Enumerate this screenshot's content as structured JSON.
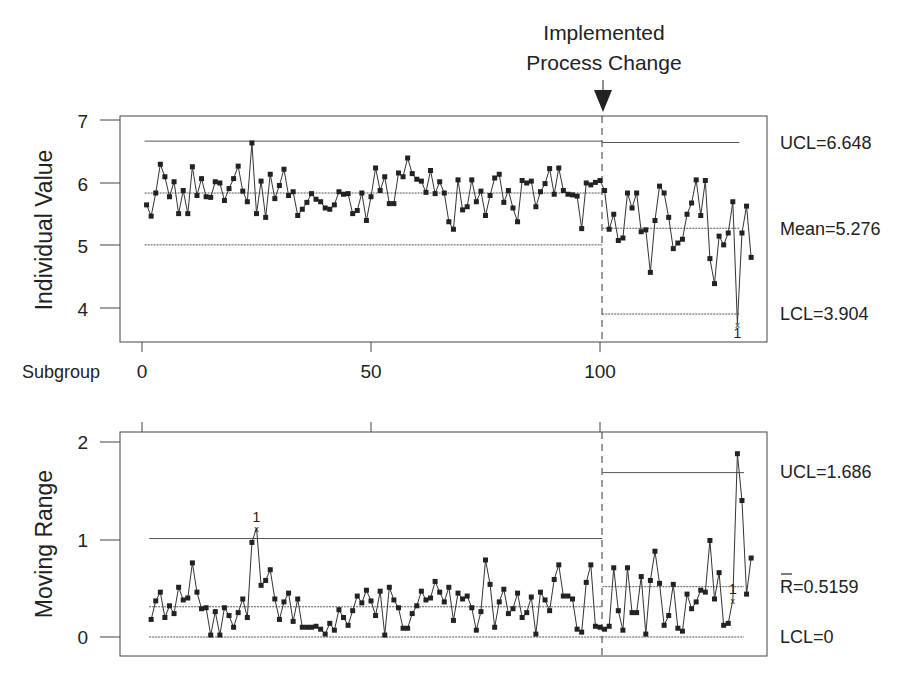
{
  "annotation": {
    "line1": "Implemented",
    "line2": "Process Change",
    "change_at_subgroup": 100.5
  },
  "chart_data": [
    {
      "type": "line",
      "title": "I Chart",
      "ylabel": "Individual Value",
      "xlabel": "Subgroup",
      "ylim": [
        3.8,
        7.05
      ],
      "yticks": [
        4,
        5,
        6,
        7
      ],
      "xticks": [
        0,
        50,
        100
      ],
      "xlim": [
        0,
        130
      ],
      "grid": false,
      "limits": {
        "phase1": {
          "UCL": 6.67,
          "center": 5.84,
          "LCL": 5.01,
          "from": 1,
          "to": 100
        },
        "phase2": {
          "UCL": 6.648,
          "center": 5.276,
          "LCL": 3.904,
          "from": 101,
          "to": 130
        }
      },
      "limit_labels": {
        "ucl": "UCL=6.648",
        "center": "Mean=5.276",
        "lcl": "LCL=3.904"
      },
      "series": [
        {
          "name": "Individual Value",
          "values": [
            5.65,
            5.47,
            5.84,
            6.3,
            6.1,
            5.78,
            6.02,
            5.51,
            5.88,
            5.51,
            6.26,
            5.8,
            6.07,
            5.78,
            5.77,
            6.02,
            6.0,
            5.72,
            5.91,
            6.07,
            6.27,
            5.87,
            5.7,
            6.64,
            5.51,
            6.03,
            5.45,
            6.14,
            5.75,
            5.96,
            6.22,
            5.8,
            5.86,
            5.48,
            5.58,
            5.69,
            5.83,
            5.74,
            5.7,
            5.6,
            5.58,
            5.65,
            5.86,
            5.82,
            5.83,
            5.51,
            5.56,
            5.84,
            5.4,
            5.78,
            6.24,
            5.88,
            6.1,
            5.67,
            5.67,
            6.16,
            6.1,
            6.4,
            6.15,
            6.06,
            6.03,
            5.85,
            6.2,
            5.83,
            6.02,
            5.84,
            5.38,
            5.26,
            6.05,
            5.57,
            5.62,
            6.05,
            5.7,
            5.87,
            5.48,
            5.8,
            6.08,
            6.14,
            5.69,
            5.88,
            5.6,
            5.38,
            6.04,
            6.0,
            6.03,
            5.62,
            5.86,
            5.99,
            6.23,
            5.82,
            6.24,
            5.88,
            5.82,
            5.81,
            5.79,
            5.27,
            6.0,
            5.97,
            6.01,
            6.04,
            5.88,
            5.26,
            5.5,
            5.08,
            5.12,
            5.84,
            5.6,
            5.84,
            5.22,
            5.25,
            4.57,
            5.4,
            5.95,
            5.84,
            5.45,
            4.95,
            5.04,
            5.1,
            5.5,
            5.68,
            6.05,
            5.48,
            6.04,
            4.79,
            4.39,
            5.15,
            5.01,
            5.2,
            5.7,
            3.75,
            5.2,
            5.63,
            4.81
          ],
          "out_of_control": [
            {
              "index": 130,
              "label": "1"
            }
          ]
        }
      ]
    },
    {
      "type": "line",
      "title": "MR Chart",
      "ylabel": "Moving Range",
      "ylim": [
        -0.1,
        2.1
      ],
      "yticks": [
        0,
        1,
        2
      ],
      "xticks": [
        0,
        50,
        100
      ],
      "grid": false,
      "limits": {
        "phase1": {
          "UCL": 1.01,
          "center": 0.31,
          "LCL": 0,
          "from": 2,
          "to": 100
        },
        "phase2": {
          "UCL": 1.686,
          "center": 0.5159,
          "LCL": 0,
          "from": 101,
          "to": 131
        }
      },
      "limit_labels": {
        "ucl": "UCL=1.686",
        "center": "R=0.5159",
        "center_bar": "R",
        "lcl": "LCL=0"
      },
      "series": [
        {
          "name": "Moving Range",
          "start_index": 2,
          "values": [
            0.18,
            0.37,
            0.46,
            0.2,
            0.32,
            0.24,
            0.51,
            0.38,
            0.4,
            0.76,
            0.46,
            0.29,
            0.3,
            0.02,
            0.26,
            0.02,
            0.3,
            0.22,
            0.1,
            0.25,
            0.39,
            0.2,
            0.97,
            1.12,
            0.53,
            0.58,
            0.69,
            0.39,
            0.18,
            0.36,
            0.45,
            0.16,
            0.39,
            0.1,
            0.1,
            0.1,
            0.11,
            0.08,
            0.03,
            0.14,
            0.07,
            0.28,
            0.2,
            0.12,
            0.27,
            0.42,
            0.35,
            0.48,
            0.37,
            0.22,
            0.47,
            0.02,
            0.51,
            0.38,
            0.3,
            0.09,
            0.09,
            0.24,
            0.32,
            0.47,
            0.38,
            0.4,
            0.57,
            0.46,
            0.36,
            0.51,
            0.17,
            0.45,
            0.39,
            0.42,
            0.3,
            0.07,
            0.26,
            0.79,
            0.54,
            0.1,
            0.36,
            0.49,
            0.24,
            0.29,
            0.45,
            0.2,
            0.25,
            0.41,
            0.03,
            0.46,
            0.38,
            0.27,
            0.59,
            0.74,
            0.42,
            0.42,
            0.39,
            0.08,
            0.05,
            0.56,
            0.74,
            0.11,
            0.1,
            0.08,
            0.11,
            0.71,
            0.27,
            0.07,
            0.71,
            0.25,
            0.25,
            0.62,
            0.03,
            0.58,
            0.88,
            0.55,
            0.12,
            0.22,
            0.54,
            0.09,
            0.06,
            0.44,
            0.29,
            0.36,
            0.48,
            0.46,
            0.99,
            0.39,
            0.66,
            0.12,
            0.14,
            0.38,
            1.88,
            1.4,
            0.44,
            0.81
          ],
          "out_of_control": [
            {
              "index": 25,
              "label": "1"
            },
            {
              "index": 129,
              "label": "1"
            }
          ]
        }
      ]
    }
  ],
  "axis": {
    "top_yticks": [
      "7",
      "6",
      "5",
      "4"
    ],
    "bottom_yticks": [
      "2",
      "1",
      "0"
    ],
    "xticks": [
      "0",
      "50",
      "100"
    ],
    "subgroup_label": "Subgroup"
  },
  "labels": {
    "top_ylabel": "Individual Value",
    "bottom_ylabel": "Moving Range",
    "top_ucl": "UCL=6.648",
    "top_mean": "Mean=5.276",
    "top_lcl": "LCL=3.904",
    "bottom_ucl": "UCL=1.686",
    "bottom_rbar": "R=0.5159",
    "bottom_lcl": "LCL=0",
    "ooc_marker": "1"
  },
  "colors": {
    "ink": "#222222",
    "line": "#333333",
    "limit": "#555555",
    "frame": "#444444"
  }
}
